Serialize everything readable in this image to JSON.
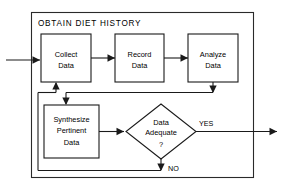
{
  "diagram": {
    "title": "OBTAIN  DIET  HISTORY",
    "type": "flowchart",
    "colors": {
      "stroke": "#1a1a1a",
      "background": "#ffffff",
      "text": "#000000"
    },
    "nodes": [
      {
        "id": "collect",
        "shape": "rectangle",
        "line1": "Collect",
        "line2": "Data"
      },
      {
        "id": "record",
        "shape": "rectangle",
        "line1": "Record",
        "line2": "Data"
      },
      {
        "id": "analyze",
        "shape": "rectangle",
        "line1": "Analyze",
        "line2": "Data"
      },
      {
        "id": "synthesize",
        "shape": "rectangle",
        "line1": "Synthesize",
        "line2": "Pertinent",
        "line3": "Data"
      },
      {
        "id": "decision",
        "shape": "diamond",
        "line1": "Data",
        "line2": "Adequate",
        "line3": "?"
      }
    ],
    "branch_labels": {
      "yes": "YES",
      "no": "NO"
    }
  }
}
